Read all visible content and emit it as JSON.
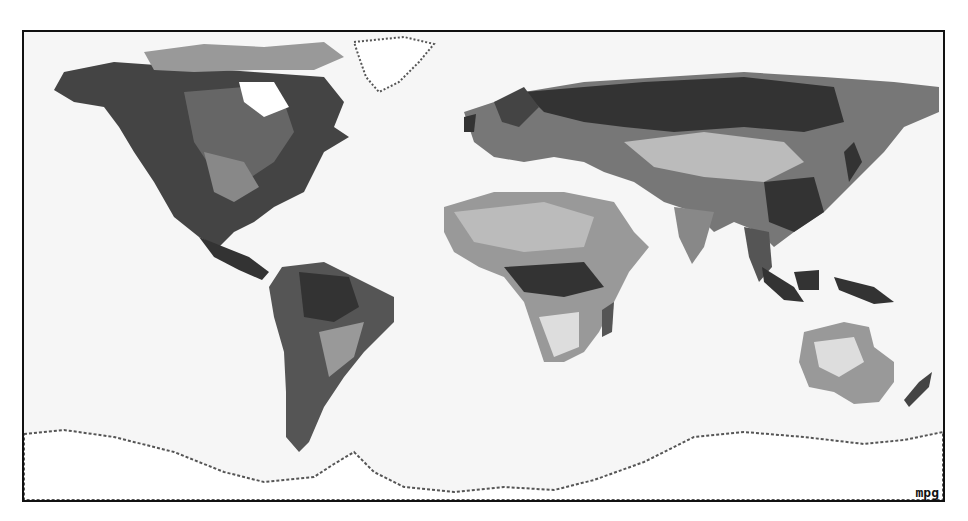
{
  "map": {
    "title": "World relief map (grayscale dithered)",
    "label": "mpg",
    "projection": "equirectangular",
    "palette": {
      "ocean": "#f6f6f6",
      "frame": "#111111",
      "lowland_dark": "#333333",
      "midland": "#666666",
      "upland": "#999999",
      "plateau": "#bbbbbb",
      "desert_light": "#dddddd",
      "ice": "#ffffff"
    },
    "regions": [
      "North America",
      "Greenland",
      "South America",
      "Europe",
      "Africa",
      "Asia",
      "Australia",
      "Antarctica"
    ]
  }
}
